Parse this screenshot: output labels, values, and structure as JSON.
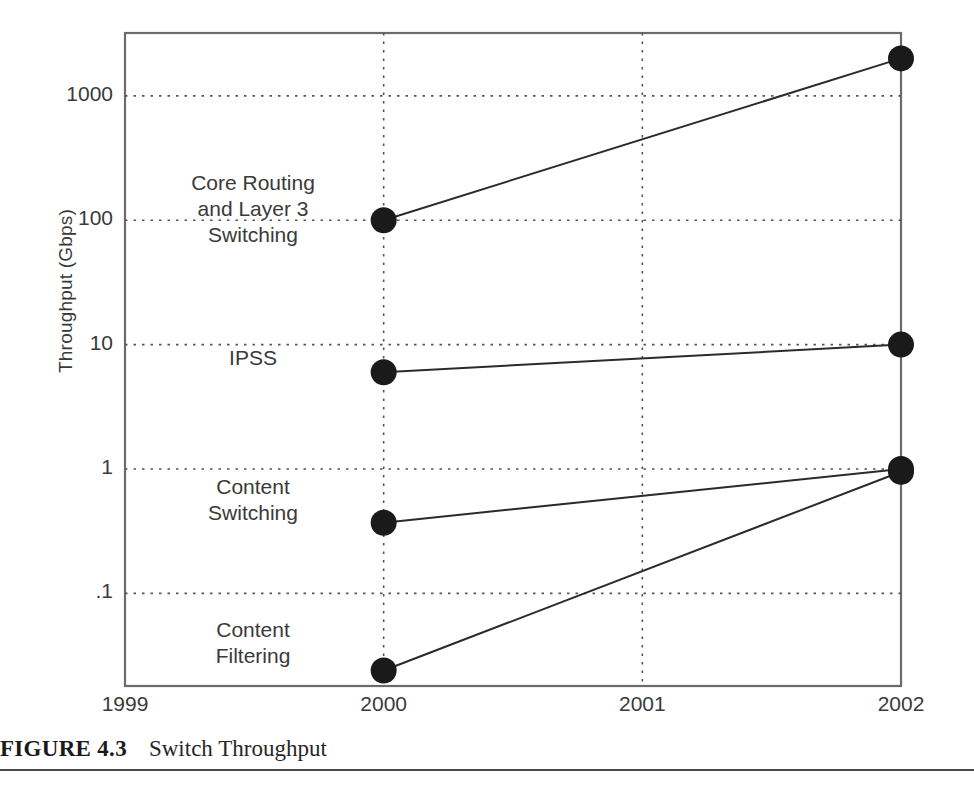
{
  "caption": {
    "label": "FIGURE 4.3",
    "title": "Switch Throughput"
  },
  "chart_data": {
    "type": "line",
    "title": "Switch Throughput",
    "xlabel": "",
    "ylabel": "Throughput (Gbps)",
    "yscale": "log",
    "grid": true,
    "legend_position": "inline-labels",
    "x": [
      1999,
      2000,
      2001,
      2002
    ],
    "xticklabels": [
      "1999",
      "2000",
      "2001",
      "2002"
    ],
    "xlim": [
      1999,
      2002
    ],
    "yticks": [
      1000,
      100,
      10,
      1,
      0.1
    ],
    "yticklabels": [
      "1000",
      "100",
      "10",
      "1",
      ".1"
    ],
    "ylim": [
      0.018,
      3200
    ],
    "series": [
      {
        "name": "Core Routing and Layer 3 Switching",
        "label_lines": [
          "Core Routing",
          "and Layer 3",
          "Switching"
        ],
        "points": [
          {
            "x": 2000,
            "y": 100
          },
          {
            "x": 2002,
            "y": 2000
          }
        ]
      },
      {
        "name": "IPSS",
        "label_lines": [
          "IPSS"
        ],
        "points": [
          {
            "x": 2000,
            "y": 6
          },
          {
            "x": 2002,
            "y": 10
          }
        ]
      },
      {
        "name": "Content Switching",
        "label_lines": [
          "Content",
          "Switching"
        ],
        "points": [
          {
            "x": 2000,
            "y": 0.37
          },
          {
            "x": 2002,
            "y": 1
          }
        ]
      },
      {
        "name": "Content Filtering",
        "label_lines": [
          "Content",
          "Filtering"
        ],
        "points": [
          {
            "x": 2000,
            "y": 0.024
          },
          {
            "x": 2002,
            "y": 0.95
          }
        ]
      }
    ]
  },
  "style": {
    "line_color": "#2b2b2b",
    "marker_color": "#1a1a1a",
    "grid_color": "#555555",
    "frame_color": "#6b6b6b",
    "text_color": "#3a3a3a"
  }
}
